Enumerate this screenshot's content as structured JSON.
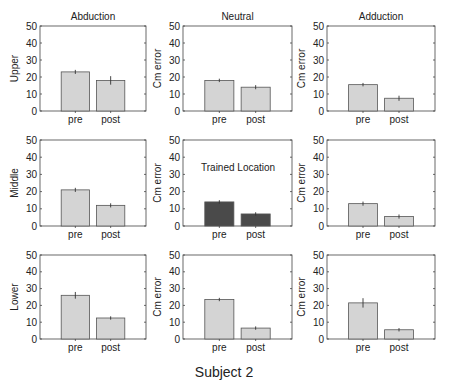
{
  "figure": {
    "title": "Subject 2",
    "column_titles": [
      "Abduction",
      "Neutral",
      "Adduction"
    ],
    "row_labels": [
      "Upper",
      "Middle",
      "Lower"
    ],
    "ylabel_other": "Cm error",
    "annotation": "Trained Location",
    "colors": {
      "bar": "#d4d4d4",
      "bar_trained": "#4a4a4a",
      "edge": "#555555",
      "axis": "#444444"
    }
  },
  "chart_data": {
    "type": "bar",
    "title": "Subject 2",
    "categories": [
      "pre",
      "post"
    ],
    "ylim": [
      0,
      50
    ],
    "yticks": [
      0,
      10,
      20,
      30,
      40,
      50
    ],
    "grid": false,
    "layout": {
      "rows": 3,
      "cols": 3
    },
    "panels": [
      {
        "row": "Upper",
        "col": "Abduction",
        "title": "Abduction",
        "ylabel": "Upper",
        "values": [
          23,
          18
        ],
        "errors": [
          1.2,
          2.5
        ]
      },
      {
        "row": "Upper",
        "col": "Neutral",
        "title": "Neutral",
        "ylabel": "Cm error",
        "values": [
          18,
          14
        ],
        "errors": [
          1.0,
          1.2
        ]
      },
      {
        "row": "Upper",
        "col": "Adduction",
        "title": "Adduction",
        "ylabel": "Cm error",
        "values": [
          15.5,
          7.5
        ],
        "errors": [
          1.0,
          1.5
        ]
      },
      {
        "row": "Middle",
        "col": "Abduction",
        "ylabel": "Middle",
        "values": [
          21,
          12
        ],
        "errors": [
          1.2,
          1.2
        ]
      },
      {
        "row": "Middle",
        "col": "Neutral",
        "ylabel": "Cm error",
        "annotation": "Trained Location",
        "trained": true,
        "values": [
          14,
          7
        ],
        "errors": [
          1.0,
          1.0
        ]
      },
      {
        "row": "Middle",
        "col": "Adduction",
        "ylabel": "Cm error",
        "values": [
          13,
          5.5
        ],
        "errors": [
          1.2,
          1.2
        ]
      },
      {
        "row": "Lower",
        "col": "Abduction",
        "ylabel": "Lower",
        "values": [
          26,
          12.5
        ],
        "errors": [
          2.0,
          1.0
        ]
      },
      {
        "row": "Lower",
        "col": "Neutral",
        "ylabel": "Cm error",
        "values": [
          23.5,
          6.5
        ],
        "errors": [
          1.0,
          1.0
        ]
      },
      {
        "row": "Lower",
        "col": "Adduction",
        "ylabel": "Cm error",
        "values": [
          21.5,
          5.5
        ],
        "errors": [
          2.8,
          1.0
        ]
      }
    ]
  }
}
